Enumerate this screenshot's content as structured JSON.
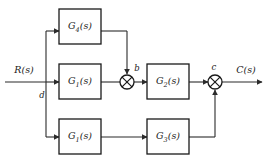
{
  "diagram": {
    "type": "control-system-block-diagram",
    "input_label": "R(s)",
    "output_label": "C(s)",
    "line_color": "#2b2b2b",
    "box_fill": "#ffffff",
    "box_stroke": "#1a1a1a",
    "blocks": [
      {
        "id": "g4",
        "name": "G",
        "sub": "4",
        "suffix": "(s)",
        "text": "G4(s)"
      },
      {
        "id": "g1",
        "name": "G",
        "sub": "1",
        "suffix": "(s)",
        "text": "G1(s)"
      },
      {
        "id": "g2",
        "name": "G",
        "sub": "2",
        "suffix": "(s)",
        "text": "G2(s)"
      },
      {
        "id": "g1b",
        "name": "G",
        "sub": "1",
        "suffix": "(s)",
        "text": "G1(s)"
      },
      {
        "id": "g3",
        "name": "G",
        "sub": "3",
        "suffix": "(s)",
        "text": "G3(s)"
      }
    ],
    "nodes": [
      {
        "id": "b",
        "label": "b",
        "kind": "summing-junction"
      },
      {
        "id": "c",
        "label": "c",
        "kind": "summing-junction"
      },
      {
        "id": "d",
        "label": "d",
        "kind": "branch-point"
      }
    ]
  }
}
